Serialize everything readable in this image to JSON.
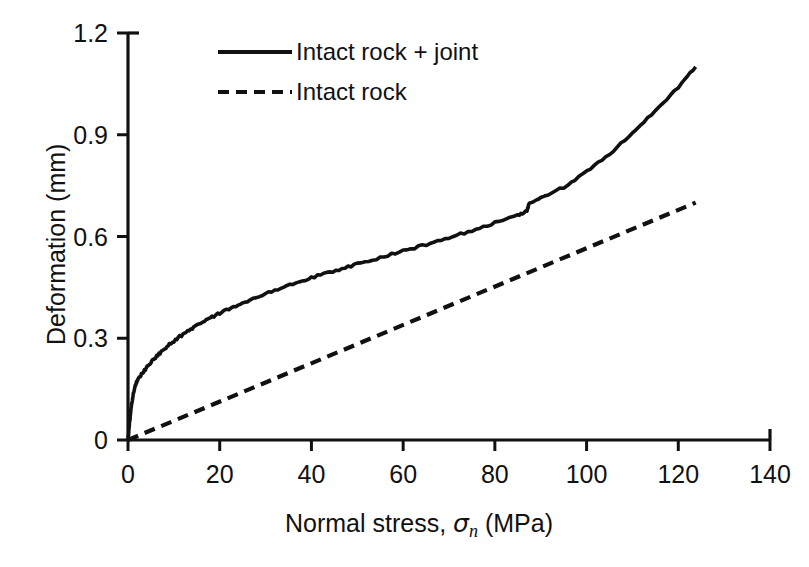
{
  "chart_data": {
    "type": "line",
    "title": "",
    "xlabel": "Normal stress, σn (MPa)",
    "xlabel_prefix": "Normal stress, ",
    "xlabel_symbol": "σ",
    "xlabel_subscript": "n",
    "xlabel_suffix": " (MPa)",
    "ylabel": "Deformation (mm)",
    "xlim": [
      0,
      140
    ],
    "ylim": [
      0,
      1.2
    ],
    "xticks": [
      0,
      20,
      40,
      60,
      80,
      100,
      120,
      140
    ],
    "xticklabels": [
      "0",
      "20",
      "40",
      "60",
      "80",
      "100",
      "120",
      "140"
    ],
    "yticks": [
      0,
      0.3,
      0.6,
      0.9,
      1.2
    ],
    "yticklabels": [
      "0",
      "0.3",
      "0.6",
      "0.9",
      "1.2"
    ],
    "grid": false,
    "legend_position": "top-center",
    "line_color": "#111111",
    "series": [
      {
        "name": "Intact rock + joint",
        "style": "solid",
        "x": [
          0,
          0.3,
          0.6,
          1.0,
          1.5,
          2.0,
          2.6,
          3.2,
          4.0,
          5.0,
          6.0,
          7.5,
          9.0,
          11.0,
          13.0,
          15.0,
          17.5,
          20.0,
          23.0,
          26.0,
          30.0,
          34.0,
          38.0,
          42.0,
          46.0,
          50.0,
          55.0,
          60.0,
          65.0,
          70.0,
          75.0,
          80.0,
          85.0,
          87.0,
          87.5,
          90.0,
          95.0,
          100.0,
          105.0,
          110.0,
          115.0,
          120.0,
          123.8
        ],
        "values": [
          0,
          0.045,
          0.085,
          0.125,
          0.158,
          0.175,
          0.188,
          0.198,
          0.212,
          0.228,
          0.243,
          0.263,
          0.281,
          0.302,
          0.321,
          0.338,
          0.357,
          0.374,
          0.393,
          0.41,
          0.432,
          0.452,
          0.47,
          0.487,
          0.503,
          0.519,
          0.538,
          0.557,
          0.576,
          0.596,
          0.617,
          0.64,
          0.664,
          0.673,
          0.7,
          0.714,
          0.745,
          0.79,
          0.843,
          0.905,
          0.97,
          1.04,
          1.1
        ]
      },
      {
        "name": "Intact rock",
        "style": "dashed",
        "x": [
          0,
          123.8
        ],
        "values": [
          0,
          0.7
        ]
      }
    ]
  },
  "legend": {
    "items": [
      {
        "label": "Intact rock + joint",
        "style": "solid"
      },
      {
        "label": "Intact rock",
        "style": "dashed"
      }
    ]
  }
}
